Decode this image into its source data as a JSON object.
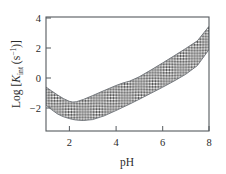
{
  "figure": {
    "background_color": "#ffffff",
    "frame_color": "#555a5e",
    "text_color": "#2b2b2b",
    "band_hatch_color": "#4a4a4a"
  },
  "axes": {
    "x": {
      "title": "pH",
      "tick_labels": [
        "2",
        "4",
        "6",
        "8"
      ],
      "tick_values": [
        2,
        4,
        6,
        8
      ],
      "range": [
        1,
        8
      ]
    },
    "y": {
      "title_parts": {
        "prefix": "Log [",
        "symbol": "K",
        "subscript": "int",
        "open_paren": " (s",
        "superscript": "−1",
        "close": ")]"
      },
      "title_plain": "Log [Kint (s−1)]",
      "tick_labels": [
        "4",
        "2",
        "0",
        "−2"
      ],
      "tick_values": [
        4,
        2,
        0,
        -2
      ],
      "range": [
        -3.53,
        4.07
      ]
    }
  },
  "chart_data": {
    "type": "area",
    "title": "",
    "subtitle": "",
    "xlabel": "pH",
    "ylabel": "Log [Kint (s−1)]",
    "xlim": [
      1,
      8
    ],
    "ylim": [
      -3.53,
      4.07
    ],
    "xticks": [
      2,
      4,
      6,
      8
    ],
    "yticks": [
      4,
      2,
      0,
      -2
    ],
    "grid": false,
    "legend": null,
    "legend_position": "none",
    "annotations": [],
    "fill_style": "cross-hatch",
    "x": [
      1.0,
      1.25,
      1.5,
      1.75,
      2.0,
      2.15,
      2.3,
      2.6,
      3.0,
      3.5,
      4.0,
      4.3,
      4.6,
      5.0,
      5.5,
      6.0,
      6.5,
      7.0,
      7.5,
      8.0
    ],
    "series": [
      {
        "name": "upper envelope",
        "values": [
          -0.6,
          -0.87,
          -1.13,
          -1.37,
          -1.55,
          -1.6,
          -1.58,
          -1.43,
          -1.17,
          -0.83,
          -0.5,
          -0.33,
          -0.2,
          0.08,
          0.53,
          1.0,
          1.48,
          1.97,
          2.48,
          3.45
        ]
      },
      {
        "name": "lower envelope",
        "values": [
          -1.8,
          -2.12,
          -2.4,
          -2.58,
          -2.7,
          -2.76,
          -2.8,
          -2.83,
          -2.77,
          -2.52,
          -2.17,
          -1.95,
          -1.73,
          -1.42,
          -1.02,
          -0.62,
          -0.2,
          0.25,
          0.83,
          1.9
        ]
      }
    ]
  }
}
